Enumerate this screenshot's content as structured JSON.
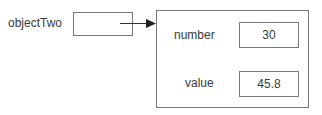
{
  "reference": {
    "name": "objectTwo"
  },
  "object": {
    "fields": [
      {
        "name": "number",
        "value": "30"
      },
      {
        "name": "value",
        "value": "45.8"
      }
    ]
  }
}
